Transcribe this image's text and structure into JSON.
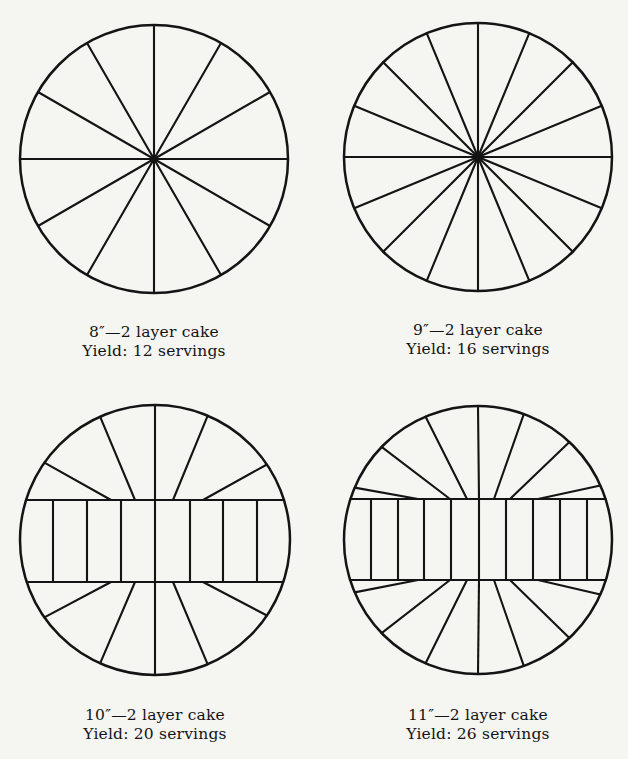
{
  "figure": {
    "ink_color": "#141414",
    "background_color": "#f5f5f2",
    "cakes": [
      {
        "size_label": "8″—2 layer cake",
        "yield_label": "Yield: 12 servings",
        "diameter_inches": 8,
        "layers": 2,
        "servings": 12,
        "cut_pattern": "radial",
        "radial_wedges": 12
      },
      {
        "size_label": "9″—2 layer cake",
        "yield_label": "Yield: 16 servings",
        "diameter_inches": 9,
        "layers": 2,
        "servings": 16,
        "cut_pattern": "radial",
        "radial_wedges": 16
      },
      {
        "size_label": "10″—2 layer cake",
        "yield_label": "Yield: 20 servings",
        "diameter_inches": 10,
        "layers": 2,
        "servings": 20,
        "cut_pattern": "center-band",
        "band_slices": 8,
        "top_cap_wedges": 6,
        "bottom_cap_wedges": 6
      },
      {
        "size_label": "11″—2 layer cake",
        "yield_label": "Yield: 26 servings",
        "diameter_inches": 11,
        "layers": 2,
        "servings": 26,
        "cut_pattern": "center-band",
        "band_slices": 10,
        "top_cap_wedges": 8,
        "bottom_cap_wedges": 8
      }
    ]
  }
}
